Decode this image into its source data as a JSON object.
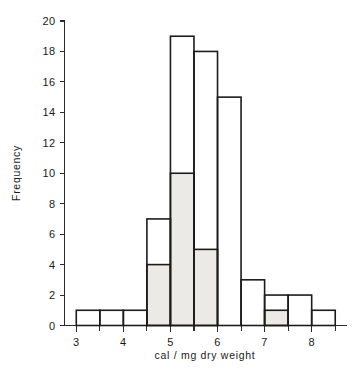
{
  "chart_data": {
    "type": "bar",
    "title": "",
    "subtitle": "",
    "xlabel": "cal / mg  dry  weight",
    "ylabel": "Frequency",
    "xlim": [
      2.75,
      8.75
    ],
    "ylim": [
      0,
      20
    ],
    "grid": false,
    "legend_position": "none",
    "bin_width": 0.5,
    "bin_edges": [
      3.0,
      3.5,
      4.0,
      4.5,
      5.0,
      5.5,
      6.0,
      6.5,
      7.0,
      7.5,
      8.0,
      8.5
    ],
    "categories": [
      "3.0-3.5",
      "3.5-4.0",
      "4.0-4.5",
      "4.5-5.0",
      "5.0-5.5",
      "5.5-6.0",
      "6.0-6.5",
      "6.5-7.0",
      "7.0-7.5",
      "7.5-8.0",
      "8.0-8.5"
    ],
    "values": [
      1,
      1,
      1,
      7,
      19,
      18,
      15,
      3,
      2,
      2,
      1
    ],
    "series": [
      {
        "name": "total",
        "values": [
          1,
          1,
          1,
          7,
          19,
          18,
          15,
          3,
          2,
          2,
          1
        ]
      },
      {
        "name": "shaded",
        "values": [
          0,
          0,
          0,
          4,
          10,
          5,
          0,
          0,
          1,
          0,
          0
        ]
      }
    ],
    "xticks": [
      3,
      4,
      5,
      6,
      7,
      8
    ],
    "xtick_labels": [
      "3",
      "4",
      "5",
      "6",
      "7",
      "8"
    ],
    "xminor_ticks": [
      3.5,
      4.5,
      5.5,
      6.5,
      7.5,
      8.5
    ],
    "yticks": [
      0,
      2,
      4,
      6,
      8,
      10,
      12,
      14,
      16,
      18,
      20
    ],
    "ytick_labels": [
      "0",
      "2",
      "4",
      "6",
      "8",
      "10",
      "12",
      "14",
      "16",
      "18",
      "20"
    ],
    "total_count": 70,
    "shaded_count": 20
  },
  "axes": {
    "y_title": "Frequency",
    "x_title": "cal / mg  dry  weight"
  }
}
